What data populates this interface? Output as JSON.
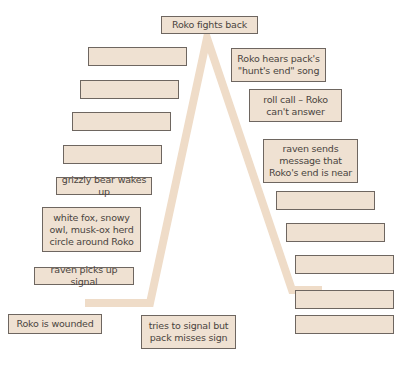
{
  "diagram": {
    "type": "plot-mountain",
    "line_color": "#efdcc8",
    "box_fill": "#efe1d2",
    "box_border": "#6e6660",
    "peak": {
      "label": "Roko fights back"
    },
    "rising_action": [
      {
        "label": "Roko is wounded"
      },
      {
        "label": "tries to signal but pack misses sign"
      },
      {
        "label": "raven picks up signal"
      },
      {
        "label": "white fox, snowy owl, musk-ox herd circle around Roko"
      },
      {
        "label": "grizzly bear wakes up"
      },
      {
        "label": ""
      },
      {
        "label": ""
      },
      {
        "label": ""
      },
      {
        "label": ""
      }
    ],
    "falling_action": [
      {
        "label": "Roko hears pack's \"hunt's end\" song"
      },
      {
        "label": "roll call – Roko can't answer"
      },
      {
        "label": "raven sends message that Roko's end is near"
      },
      {
        "label": ""
      },
      {
        "label": ""
      },
      {
        "label": ""
      },
      {
        "label": ""
      },
      {
        "label": ""
      }
    ]
  }
}
